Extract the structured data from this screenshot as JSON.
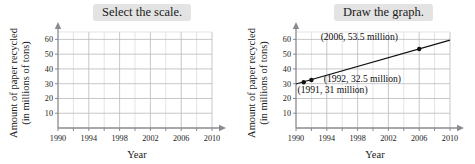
{
  "panels": [
    {
      "id": "select-the-scale",
      "banner_label": "Select the scale.",
      "chart_data": {
        "type": "line",
        "title": "Select the scale.",
        "xlabel": "Year",
        "ylabel": "Amount of paper recycled (in millions of tons)",
        "ylabel_line1": "Amount of paper recycled",
        "ylabel_line2": "(in millions of tons)",
        "xlim": [
          1990,
          2010
        ],
        "ylim": [
          0,
          65
        ],
        "x_ticks": [
          1990,
          1994,
          1998,
          2002,
          2006,
          2010
        ],
        "x_tick_labels": [
          "1990",
          "1994",
          "1998",
          "2002",
          "2006",
          "2010"
        ],
        "x_minor_step": 2,
        "y_ticks": [
          10,
          20,
          30,
          40,
          50,
          60
        ],
        "y_tick_labels": [
          "10",
          "20",
          "30",
          "40",
          "50",
          "60"
        ],
        "grid": true,
        "legend": "none",
        "series": [],
        "annotations": []
      }
    },
    {
      "id": "draw-the-graph",
      "banner_label": "Draw the graph.",
      "chart_data": {
        "type": "line",
        "title": "Draw the graph.",
        "xlabel": "Year",
        "ylabel": "Amount of paper recycled (in millions of tons)",
        "ylabel_line1": "Amount of paper recycled",
        "ylabel_line2": "(in millions of tons)",
        "xlim": [
          1990,
          2010
        ],
        "ylim": [
          0,
          65
        ],
        "x_ticks": [
          1990,
          1994,
          1998,
          2002,
          2006,
          2010
        ],
        "x_tick_labels": [
          "1990",
          "1994",
          "1998",
          "2002",
          "2006",
          "2010"
        ],
        "x_minor_step": 2,
        "y_ticks": [
          10,
          20,
          30,
          40,
          50,
          60
        ],
        "y_tick_labels": [
          "10",
          "20",
          "30",
          "40",
          "50",
          "60"
        ],
        "grid": true,
        "legend": "none",
        "series": [
          {
            "name": "Paper recycled",
            "x": [
              1991,
              1992,
              2006
            ],
            "values": [
              31,
              32.5,
              53.5
            ],
            "points": [
              {
                "x": 1991,
                "y": 31
              },
              {
                "x": 1992,
                "y": 32.5
              },
              {
                "x": 2006,
                "y": 53.5
              }
            ],
            "trend_line": {
              "x": [
                1990,
                2010
              ],
              "y": [
                29.8,
                59.5
              ]
            },
            "color": "#111111"
          }
        ],
        "annotations": [
          {
            "text": "(2006, 53.5 million)",
            "x": 1993.2,
            "y": 59.5
          },
          {
            "text": "(1992, 32.5 million)",
            "x": 1993.6,
            "y": 31.0
          },
          {
            "text": "(1991, 31 million)",
            "x": 1990.2,
            "y": 23.5
          }
        ]
      }
    }
  ]
}
